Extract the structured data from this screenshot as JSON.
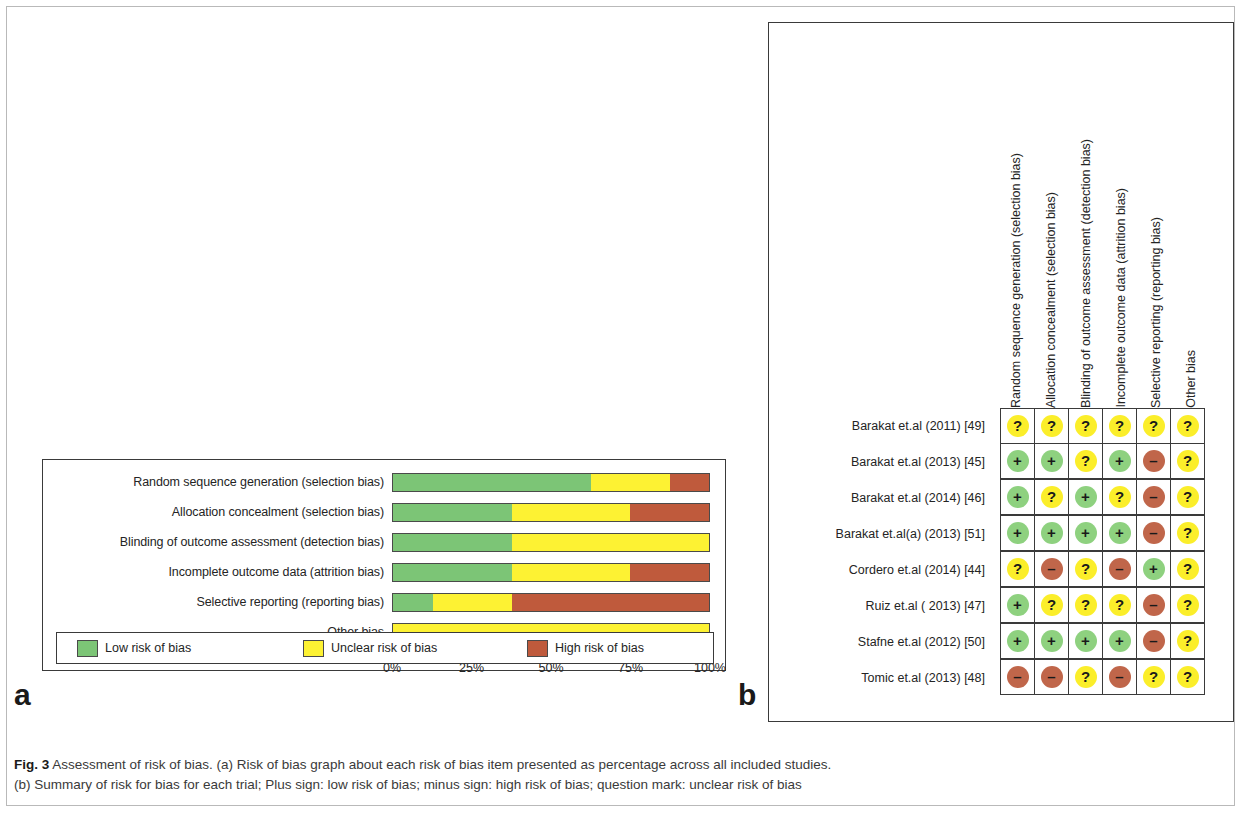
{
  "figure": {
    "label": "Fig. 3",
    "caption_line1": "Assessment of risk of bias. (a) Risk of bias graph about each risk of bias item presented as percentage across all included studies.",
    "caption_line2": "(b) Summary of risk for bias for each trial; Plus sign: low risk of bias; minus sign: high risk of bias; question mark: unclear risk of bias",
    "caption_part_a_marker": "a",
    "caption_part_b_marker": "b"
  },
  "panel_a": {
    "letter": "a",
    "axis_ticks": [
      "0%",
      "25%",
      "50%",
      "75%",
      "100%"
    ],
    "legend": [
      {
        "key": "low",
        "label": "Low risk of bias",
        "color": "#7cc576"
      },
      {
        "key": "unclear",
        "label": "Unclear risk of bias",
        "color": "#fdf233"
      },
      {
        "key": "high",
        "label": "High risk of bias",
        "color": "#bf5a3c"
      }
    ]
  },
  "panel_b": {
    "letter": "b",
    "columns": [
      "Random sequence generation (selection bias)",
      "Allocation concealment (selection bias)",
      "Blinding of outcome assessment (detection bias)",
      "Incomplete outcome data (attrition bias)",
      "Selective reporting (reporting bias)",
      "Other bias"
    ],
    "rows": [
      {
        "study": "Barakat et.al (2011) [49]",
        "values": [
          "?",
          "?",
          "?",
          "?",
          "?",
          "?"
        ]
      },
      {
        "study": "Barakat et.al (2013) [45]",
        "values": [
          "+",
          "+",
          "?",
          "+",
          "-",
          "?"
        ]
      },
      {
        "study": "Barakat et.al (2014) [46]",
        "values": [
          "+",
          "?",
          "+",
          "?",
          "-",
          "?"
        ]
      },
      {
        "study": "Barakat et.al(a) (2013) [51]",
        "values": [
          "+",
          "+",
          "+",
          "+",
          "-",
          "?"
        ]
      },
      {
        "study": "Cordero et.al (2014) [44]",
        "values": [
          "?",
          "-",
          "?",
          "-",
          "+",
          "?"
        ]
      },
      {
        "study": "Ruiz et.al ( 2013) [47]",
        "values": [
          "+",
          "?",
          "?",
          "?",
          "-",
          "?"
        ]
      },
      {
        "study": "Stafne et.al (2012) [50]",
        "values": [
          "+",
          "+",
          "+",
          "+",
          "-",
          "?"
        ]
      },
      {
        "study": "Tomic et.al (2013) [48]",
        "values": [
          "-",
          "-",
          "?",
          "-",
          "?",
          "?"
        ]
      }
    ],
    "symbol_colors": {
      "plus": "#8ed17f",
      "minus": "#c0664a",
      "question": "#fbee2a"
    }
  },
  "chart_data": {
    "type": "bar",
    "subtype": "stacked-horizontal-percentage",
    "title": "Risk of bias graph",
    "xlabel": "",
    "ylabel": "",
    "xlim": [
      0,
      100
    ],
    "grid": false,
    "legend_position": "bottom",
    "categories": [
      "Random sequence generation (selection bias)",
      "Allocation concealment (selection bias)",
      "Blinding of outcome assessment (detection bias)",
      "Incomplete outcome data (attrition bias)",
      "Selective reporting (reporting bias)",
      "Other bias"
    ],
    "tick_labels": [
      "0%",
      "25%",
      "50%",
      "75%",
      "100%"
    ],
    "series": [
      {
        "name": "Low risk of bias",
        "color": "#7cc576",
        "values": [
          62.5,
          37.5,
          37.5,
          37.5,
          12.5,
          0
        ]
      },
      {
        "name": "Unclear risk of bias",
        "color": "#fdf233",
        "values": [
          25.0,
          37.5,
          62.5,
          37.5,
          25.0,
          100
        ]
      },
      {
        "name": "High risk of bias",
        "color": "#bf5a3c",
        "values": [
          12.5,
          25.0,
          0,
          25.0,
          62.5,
          0
        ]
      }
    ]
  }
}
